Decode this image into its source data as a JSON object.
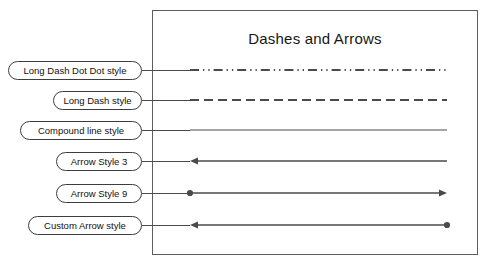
{
  "figure": {
    "title": "Dashes and Arrows",
    "background_color": "#ffffff",
    "frame_border_color": "#5d5d5d",
    "line_color": "#4a4a4a",
    "callout_border_color": "#3d3d3d",
    "text_color": "#111111"
  },
  "rows": [
    {
      "label": "Long Dash Dot Dot style",
      "style": "long-dash-dot-dot",
      "start_cap": "none",
      "end_cap": "none",
      "stroke_width": 2
    },
    {
      "label": "Long Dash style",
      "style": "long-dash",
      "start_cap": "none",
      "end_cap": "none",
      "stroke_width": 2
    },
    {
      "label": "Compound line style",
      "style": "solid",
      "start_cap": "none",
      "end_cap": "none",
      "stroke_width": 1
    },
    {
      "label": "Arrow Style 3",
      "style": "solid",
      "start_cap": "arrow",
      "end_cap": "none",
      "stroke_width": 1.6
    },
    {
      "label": "Arrow Style 9",
      "style": "solid",
      "start_cap": "dot",
      "end_cap": "arrow",
      "stroke_width": 1.6
    },
    {
      "label": "Custom Arrow style",
      "style": "solid",
      "start_cap": "arrow",
      "end_cap": "dot",
      "stroke_width": 1.6
    }
  ]
}
